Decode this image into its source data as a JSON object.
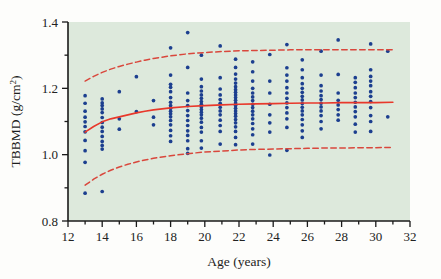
{
  "figure": {
    "background_color": "#fdfdfb",
    "plot_background_color": "#dde9dc",
    "axis_color": "#1a1a1a",
    "point_color": "#1c3f8f",
    "fit_line_color": "#e8382b",
    "band_line_color": "#d9473c"
  },
  "axes": {
    "x_title_main": "Age (years)",
    "y_title_main": "TBBMD (g/cm",
    "y_title_sup": "2",
    "y_title_close": ")",
    "x_ticks": [
      "12",
      "14",
      "16",
      "18",
      "20",
      "22",
      "24",
      "26",
      "28",
      "30",
      "32"
    ],
    "y_ticks": [
      "1.4",
      "1.2",
      "1.0",
      "0.8"
    ]
  },
  "chart_data": {
    "type": "scatter",
    "title": "",
    "xlabel": "Age (years)",
    "ylabel": "TBBMD (g/cm2)",
    "xlim": [
      12,
      32
    ],
    "ylim": [
      0.8,
      1.4
    ],
    "x_major_step": 2,
    "x_minor_step": 1,
    "y_major_step": 0.2,
    "y_minor_step": 0.1,
    "grid": false,
    "legend": "none",
    "series": [
      {
        "name": "TBBMD observations",
        "type": "scatter",
        "marker": "circle",
        "color": "#1c3f8f",
        "points": [
          [
            13.0,
            1.178
          ],
          [
            13.0,
            1.155
          ],
          [
            13.0,
            1.131
          ],
          [
            13.0,
            1.113
          ],
          [
            13.0,
            1.099
          ],
          [
            13.0,
            1.085
          ],
          [
            13.0,
            1.069
          ],
          [
            13.0,
            1.043
          ],
          [
            13.0,
            1.012
          ],
          [
            13.0,
            0.977
          ],
          [
            13.0,
            0.884
          ],
          [
            14.0,
            1.168
          ],
          [
            14.0,
            1.156
          ],
          [
            14.0,
            1.148
          ],
          [
            14.0,
            1.138
          ],
          [
            14.0,
            1.127
          ],
          [
            14.0,
            1.112
          ],
          [
            14.0,
            1.097
          ],
          [
            14.0,
            1.083
          ],
          [
            14.0,
            1.07
          ],
          [
            14.0,
            1.055
          ],
          [
            14.0,
            1.04
          ],
          [
            14.0,
            1.028
          ],
          [
            14.0,
            1.017
          ],
          [
            14.0,
            0.889
          ],
          [
            15.0,
            1.19
          ],
          [
            15.0,
            1.108
          ],
          [
            15.0,
            1.077
          ],
          [
            16.0,
            1.235
          ],
          [
            16.0,
            1.13
          ],
          [
            17.0,
            1.163
          ],
          [
            17.0,
            1.113
          ],
          [
            17.0,
            1.09
          ],
          [
            18.0,
            1.322
          ],
          [
            18.0,
            1.24
          ],
          [
            18.0,
            1.212
          ],
          [
            18.0,
            1.203
          ],
          [
            18.0,
            1.19
          ],
          [
            18.0,
            1.172
          ],
          [
            18.0,
            1.158
          ],
          [
            18.0,
            1.148
          ],
          [
            18.0,
            1.14
          ],
          [
            18.0,
            1.131
          ],
          [
            18.0,
            1.123
          ],
          [
            18.0,
            1.114
          ],
          [
            18.0,
            1.103
          ],
          [
            18.0,
            1.09
          ],
          [
            18.0,
            1.073
          ],
          [
            18.0,
            1.057
          ],
          [
            18.0,
            1.04
          ],
          [
            19.0,
            1.368
          ],
          [
            19.0,
            1.263
          ],
          [
            19.0,
            1.186
          ],
          [
            19.0,
            1.163
          ],
          [
            19.0,
            1.148
          ],
          [
            19.0,
            1.133
          ],
          [
            19.0,
            1.118
          ],
          [
            19.0,
            1.103
          ],
          [
            19.0,
            1.088
          ],
          [
            19.0,
            1.072
          ],
          [
            19.0,
            1.058
          ],
          [
            19.0,
            1.042
          ],
          [
            19.0,
            1.018
          ],
          [
            19.0,
            1.004
          ],
          [
            19.8,
            1.3
          ],
          [
            19.8,
            1.228
          ],
          [
            19.8,
            1.205
          ],
          [
            19.8,
            1.192
          ],
          [
            19.8,
            1.18
          ],
          [
            19.8,
            1.17
          ],
          [
            19.8,
            1.16
          ],
          [
            19.8,
            1.152
          ],
          [
            19.8,
            1.144
          ],
          [
            19.8,
            1.136
          ],
          [
            19.8,
            1.128
          ],
          [
            19.8,
            1.12
          ],
          [
            19.8,
            1.11
          ],
          [
            19.8,
            1.098
          ],
          [
            19.8,
            1.082
          ],
          [
            19.8,
            1.068
          ],
          [
            19.8,
            1.042
          ],
          [
            19.8,
            1.02
          ],
          [
            20.9,
            1.328
          ],
          [
            20.9,
            1.232
          ],
          [
            20.9,
            1.198
          ],
          [
            20.9,
            1.18
          ],
          [
            20.9,
            1.166
          ],
          [
            20.9,
            1.155
          ],
          [
            20.9,
            1.143
          ],
          [
            20.9,
            1.132
          ],
          [
            20.9,
            1.12
          ],
          [
            20.9,
            1.104
          ],
          [
            20.9,
            1.088
          ],
          [
            20.9,
            1.07
          ],
          [
            20.9,
            1.032
          ],
          [
            21.8,
            1.288
          ],
          [
            21.8,
            1.263
          ],
          [
            21.8,
            1.243
          ],
          [
            21.8,
            1.228
          ],
          [
            21.8,
            1.216
          ],
          [
            21.8,
            1.205
          ],
          [
            21.8,
            1.196
          ],
          [
            21.8,
            1.188
          ],
          [
            21.8,
            1.18
          ],
          [
            21.8,
            1.172
          ],
          [
            21.8,
            1.164
          ],
          [
            21.8,
            1.156
          ],
          [
            21.8,
            1.148
          ],
          [
            21.8,
            1.14
          ],
          [
            21.8,
            1.132
          ],
          [
            21.8,
            1.124
          ],
          [
            21.8,
            1.116
          ],
          [
            21.8,
            1.106
          ],
          [
            21.8,
            1.096
          ],
          [
            21.8,
            1.084
          ],
          [
            21.8,
            1.07
          ],
          [
            21.8,
            1.052
          ],
          [
            21.8,
            1.03
          ],
          [
            22.8,
            1.28
          ],
          [
            22.8,
            1.25
          ],
          [
            22.8,
            1.222
          ],
          [
            22.8,
            1.2
          ],
          [
            22.8,
            1.186
          ],
          [
            22.8,
            1.174
          ],
          [
            22.8,
            1.163
          ],
          [
            22.8,
            1.152
          ],
          [
            22.8,
            1.142
          ],
          [
            22.8,
            1.131
          ],
          [
            22.8,
            1.12
          ],
          [
            22.8,
            1.108
          ],
          [
            22.8,
            1.094
          ],
          [
            22.8,
            1.078
          ],
          [
            22.8,
            1.06
          ],
          [
            22.8,
            1.032
          ],
          [
            23.8,
            1.302
          ],
          [
            23.8,
            1.222
          ],
          [
            23.8,
            1.186
          ],
          [
            23.8,
            1.152
          ],
          [
            23.8,
            1.12
          ],
          [
            23.8,
            1.096
          ],
          [
            23.8,
            1.068
          ],
          [
            23.8,
            0.999
          ],
          [
            24.8,
            1.332
          ],
          [
            24.8,
            1.262
          ],
          [
            24.8,
            1.24
          ],
          [
            24.8,
            1.222
          ],
          [
            24.8,
            1.202
          ],
          [
            24.8,
            1.186
          ],
          [
            24.8,
            1.17
          ],
          [
            24.8,
            1.156
          ],
          [
            24.8,
            1.142
          ],
          [
            24.8,
            1.126
          ],
          [
            24.8,
            1.108
          ],
          [
            24.8,
            1.082
          ],
          [
            24.8,
            1.013
          ],
          [
            25.7,
            1.286
          ],
          [
            25.7,
            1.256
          ],
          [
            25.7,
            1.232
          ],
          [
            25.7,
            1.214
          ],
          [
            25.7,
            1.2
          ],
          [
            25.7,
            1.188
          ],
          [
            25.7,
            1.176
          ],
          [
            25.7,
            1.165
          ],
          [
            25.7,
            1.154
          ],
          [
            25.7,
            1.143
          ],
          [
            25.7,
            1.132
          ],
          [
            25.7,
            1.12
          ],
          [
            25.7,
            1.106
          ],
          [
            25.7,
            1.09
          ],
          [
            25.7,
            1.072
          ],
          [
            25.7,
            1.052
          ],
          [
            26.8,
            1.312
          ],
          [
            26.8,
            1.24
          ],
          [
            26.8,
            1.208
          ],
          [
            26.8,
            1.192
          ],
          [
            26.8,
            1.178
          ],
          [
            26.8,
            1.166
          ],
          [
            26.8,
            1.155
          ],
          [
            26.8,
            1.144
          ],
          [
            26.8,
            1.132
          ],
          [
            26.8,
            1.118
          ],
          [
            26.8,
            1.1
          ],
          [
            26.8,
            1.078
          ],
          [
            27.8,
            1.346
          ],
          [
            27.8,
            1.242
          ],
          [
            27.8,
            1.186
          ],
          [
            27.8,
            1.164
          ],
          [
            27.8,
            1.15
          ],
          [
            27.8,
            1.136
          ],
          [
            27.8,
            1.12
          ],
          [
            27.8,
            1.104
          ],
          [
            28.8,
            1.232
          ],
          [
            28.8,
            1.218
          ],
          [
            28.8,
            1.202
          ],
          [
            28.8,
            1.186
          ],
          [
            28.8,
            1.172
          ],
          [
            28.8,
            1.158
          ],
          [
            28.8,
            1.144
          ],
          [
            28.8,
            1.13
          ],
          [
            28.8,
            1.114
          ],
          [
            28.8,
            1.092
          ],
          [
            28.8,
            1.068
          ],
          [
            29.7,
            1.334
          ],
          [
            29.7,
            1.256
          ],
          [
            29.7,
            1.236
          ],
          [
            29.7,
            1.222
          ],
          [
            29.7,
            1.208
          ],
          [
            29.7,
            1.19
          ],
          [
            29.7,
            1.176
          ],
          [
            29.7,
            1.16
          ],
          [
            29.7,
            1.142
          ],
          [
            29.7,
            1.118
          ],
          [
            29.7,
            1.1
          ],
          [
            29.7,
            1.07
          ],
          [
            30.7,
            1.312
          ],
          [
            30.7,
            1.114
          ]
        ]
      },
      {
        "name": "Fitted mean curve",
        "type": "line",
        "style": "solid",
        "color": "#e8382b",
        "points": [
          [
            13.0,
            1.068
          ],
          [
            13.5,
            1.085
          ],
          [
            14.0,
            1.099
          ],
          [
            14.5,
            1.108
          ],
          [
            15.0,
            1.114
          ],
          [
            15.5,
            1.12
          ],
          [
            16.0,
            1.126
          ],
          [
            16.5,
            1.131
          ],
          [
            17.0,
            1.135
          ],
          [
            17.5,
            1.138
          ],
          [
            18.0,
            1.141
          ],
          [
            19.0,
            1.145
          ],
          [
            20.0,
            1.148
          ],
          [
            21.0,
            1.15
          ],
          [
            22.0,
            1.152
          ],
          [
            23.0,
            1.153
          ],
          [
            24.0,
            1.154
          ],
          [
            25.0,
            1.155
          ],
          [
            26.0,
            1.156
          ],
          [
            27.0,
            1.156
          ],
          [
            28.0,
            1.157
          ],
          [
            29.0,
            1.157
          ],
          [
            30.0,
            1.157
          ],
          [
            31.0,
            1.158
          ]
        ]
      },
      {
        "name": "Upper 95% band",
        "type": "line",
        "style": "dashed",
        "color": "#d9473c",
        "points": [
          [
            13.0,
            1.222
          ],
          [
            13.5,
            1.236
          ],
          [
            14.0,
            1.248
          ],
          [
            14.5,
            1.258
          ],
          [
            15.0,
            1.266
          ],
          [
            15.5,
            1.273
          ],
          [
            16.0,
            1.279
          ],
          [
            16.5,
            1.285
          ],
          [
            17.0,
            1.29
          ],
          [
            17.5,
            1.294
          ],
          [
            18.0,
            1.298
          ],
          [
            19.0,
            1.304
          ],
          [
            20.0,
            1.308
          ],
          [
            21.0,
            1.311
          ],
          [
            22.0,
            1.313
          ],
          [
            23.0,
            1.314
          ],
          [
            24.0,
            1.315
          ],
          [
            25.0,
            1.316
          ],
          [
            26.0,
            1.316
          ],
          [
            27.0,
            1.316
          ],
          [
            28.0,
            1.316
          ],
          [
            29.0,
            1.316
          ],
          [
            30.0,
            1.316
          ],
          [
            31.0,
            1.316
          ]
        ]
      },
      {
        "name": "Lower 95% band",
        "type": "line",
        "style": "dashed",
        "color": "#d9473c",
        "points": [
          [
            13.0,
            0.908
          ],
          [
            13.5,
            0.926
          ],
          [
            14.0,
            0.941
          ],
          [
            14.5,
            0.953
          ],
          [
            15.0,
            0.963
          ],
          [
            15.5,
            0.971
          ],
          [
            16.0,
            0.978
          ],
          [
            16.5,
            0.984
          ],
          [
            17.0,
            0.989
          ],
          [
            17.5,
            0.993
          ],
          [
            18.0,
            0.997
          ],
          [
            19.0,
            1.003
          ],
          [
            20.0,
            1.008
          ],
          [
            21.0,
            1.011
          ],
          [
            22.0,
            1.014
          ],
          [
            23.0,
            1.016
          ],
          [
            24.0,
            1.017
          ],
          [
            25.0,
            1.018
          ],
          [
            26.0,
            1.019
          ],
          [
            27.0,
            1.02
          ],
          [
            28.0,
            1.02
          ],
          [
            29.0,
            1.021
          ],
          [
            30.0,
            1.021
          ],
          [
            31.0,
            1.022
          ]
        ]
      }
    ]
  }
}
